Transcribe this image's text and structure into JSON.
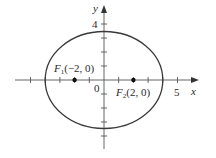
{
  "diagram": {
    "axes": {
      "x_label": "x",
      "y_label": "y",
      "x_tick_label": "5",
      "y_tick_label": "4",
      "origin_label": "0",
      "x_range": [
        -6,
        6
      ],
      "y_range": [
        -5,
        5
      ]
    },
    "ellipse": {
      "center": [
        0,
        0
      ],
      "semi_major_axis_x": 4,
      "semi_minor_axis_y": 3.46,
      "equation": "x^2/16 + y^2/12 = 1"
    },
    "foci": [
      {
        "name": "F1",
        "letter": "F",
        "subscript": "1",
        "coords": "(−2, 0)",
        "x": -2,
        "y": 0
      },
      {
        "name": "F2",
        "letter": "F",
        "subscript": "2",
        "coords": "(2, 0)",
        "x": 2,
        "y": 0
      }
    ],
    "colors": {
      "stroke": "#3a3a3a",
      "axis": "#555555",
      "text": "#2a2a2a",
      "background": "#ffffff"
    }
  }
}
